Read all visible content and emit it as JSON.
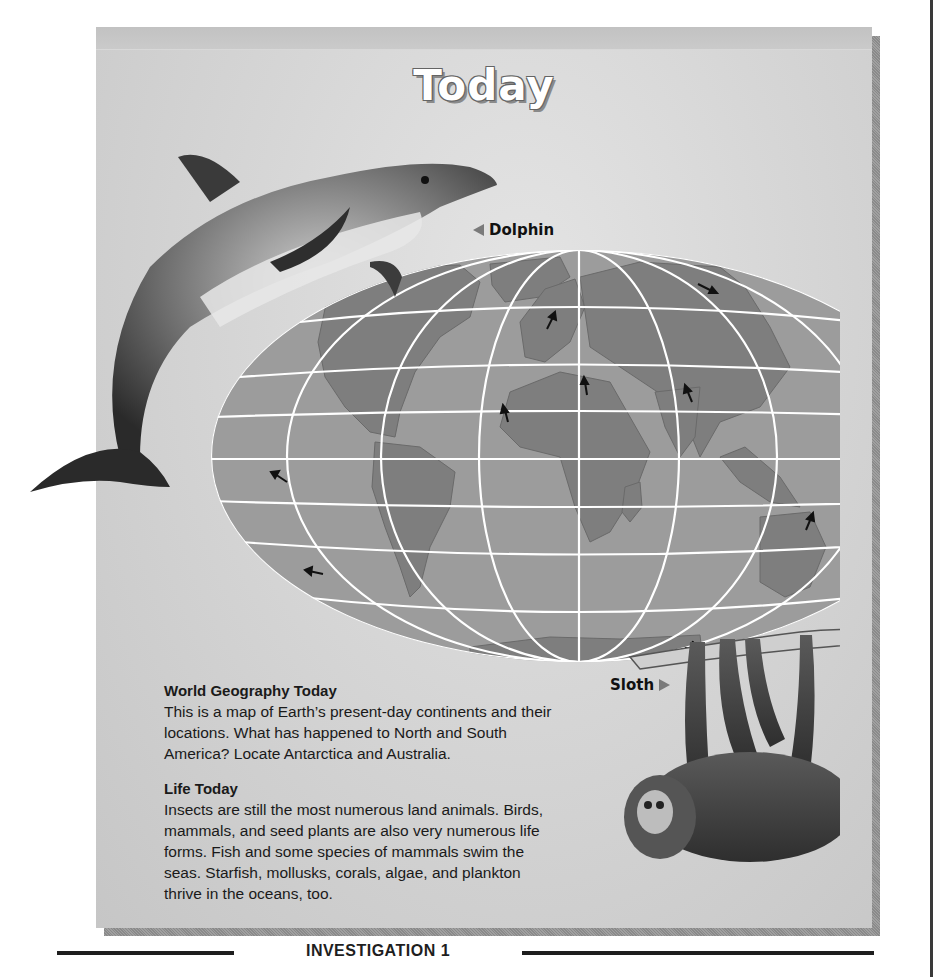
{
  "page": {
    "title": "Today",
    "labels": {
      "dolphin": "Dolphin",
      "sloth": "Sloth"
    },
    "sections": [
      {
        "heading": "World Geography Today",
        "lines": [
          "This is a map of Earth’s present-day continents and their",
          "locations. What has happened to North and South",
          "America? Locate Antarctica and Australia."
        ]
      },
      {
        "heading": "Life Today",
        "lines": [
          "Insects are still the most numerous land animals. Birds,",
          "mammals, and seed plants are also very numerous life",
          "forms. Fish and some species of mammals swim the",
          "seas. Starfish, mollusks, corals, algae, and plankton",
          "thrive in the oceans, too."
        ]
      }
    ],
    "footer": "INVESTIGATION 1",
    "map": {
      "description": "World map of present-day continents with arrows showing plate motion directions",
      "continents": [
        "North America",
        "South America",
        "Greenland",
        "Europe",
        "Africa",
        "Asia",
        "India",
        "Australia",
        "Antarctica",
        "Madagascar",
        "Indonesia"
      ],
      "arrow_count": 13
    },
    "colors": {
      "panel": "#d6d6d6",
      "ocean": "#9c9c9c",
      "land": "#7e7e7e",
      "grid": "#ffffff",
      "text": "#1a1a1a",
      "pointer": "#7a7a7a"
    }
  }
}
